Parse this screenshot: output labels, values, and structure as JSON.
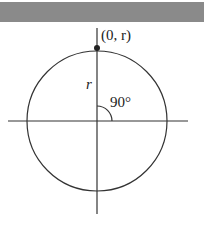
{
  "diagram": {
    "point_label": "(0, r)",
    "radius_label": "r",
    "angle_label": "90°",
    "colors": {
      "line": "#333333",
      "bar": "#8a8a8a"
    }
  }
}
